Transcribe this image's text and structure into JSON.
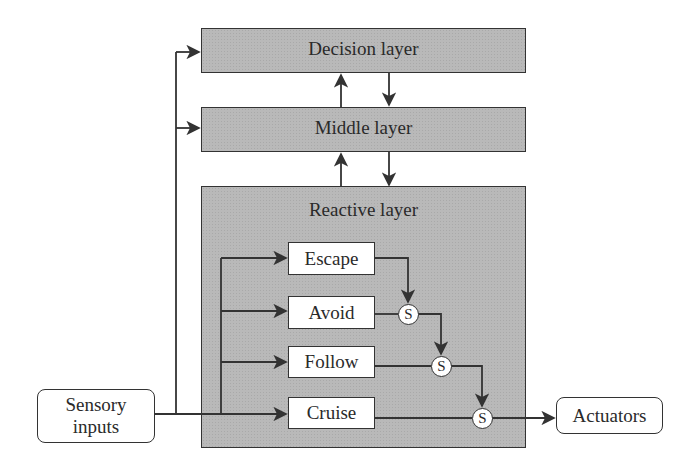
{
  "diagram": {
    "title": "",
    "layers": {
      "decision": "Decision layer",
      "middle": "Middle layer",
      "reactive": "Reactive layer"
    },
    "behaviors": [
      "Escape",
      "Avoid",
      "Follow",
      "Cruise"
    ],
    "suppressor_label": "S",
    "suppressors": [
      "S",
      "S",
      "S"
    ],
    "inputs": {
      "line1": "Sensory",
      "line2": "inputs"
    },
    "outputs": {
      "label": "Actuators"
    },
    "colors": {
      "layer_fill": "#b9b9b9",
      "stroke": "#333333",
      "box_fill": "#ffffff"
    }
  }
}
